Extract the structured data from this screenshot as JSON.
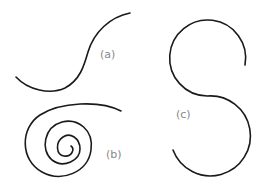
{
  "figure": {
    "panels": [
      {
        "id": "a",
        "label": "(a)",
        "shape": "s-curve"
      },
      {
        "id": "b",
        "label": "(b)",
        "shape": "spiral"
      },
      {
        "id": "c",
        "label": "(c)",
        "shape": "s-shape-two-semicircles"
      }
    ]
  },
  "colors": {
    "stroke": "#1a1a1a",
    "label": "#888888",
    "background": "#ffffff"
  }
}
